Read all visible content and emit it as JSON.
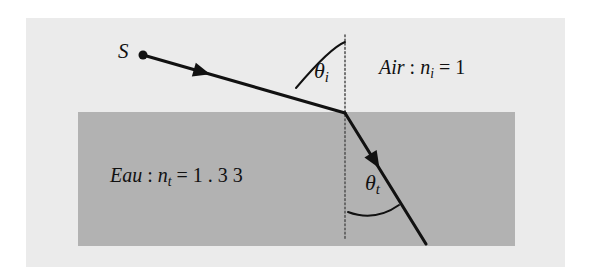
{
  "figure": {
    "kind": "optics-refraction-diagram",
    "colors": {
      "page_background": "#ffffff",
      "panel_background": "#ebebeb",
      "water_fill": "#b2b2b2",
      "ray_color": "#111111",
      "normal_line_color": "#555555",
      "text_color": "#111111"
    },
    "panel": {
      "x": 26,
      "y": 18,
      "width": 539,
      "height": 249
    },
    "water_region": {
      "x": 78,
      "y": 112,
      "width": 437,
      "height": 134
    },
    "normal_line": {
      "x": 345,
      "y_top": 35,
      "y_bottom": 240,
      "style": "dotted"
    },
    "interface_point": {
      "x": 345,
      "y": 113
    },
    "incident_ray": {
      "from": {
        "x": 143,
        "y": 55
      },
      "to": {
        "x": 345,
        "y": 113
      },
      "arrow_at": {
        "x": 202,
        "y": 72
      }
    },
    "refracted_ray": {
      "from": {
        "x": 345,
        "y": 113
      },
      "to": {
        "x": 426,
        "y": 244
      },
      "arrow_at": {
        "x": 375,
        "y": 161
      }
    },
    "source_dot": {
      "x": 143,
      "y": 55,
      "radius": 4.5
    }
  },
  "labels": {
    "source": "S",
    "theta_incident": {
      "symbol": "θ",
      "subscript": "i"
    },
    "theta_transmitted": {
      "symbol": "θ",
      "subscript": "t"
    },
    "air": {
      "medium": "Air",
      "separator": " : ",
      "index_symbol": "n",
      "index_subscript": "i",
      "equals": " = ",
      "value": "1"
    },
    "water": {
      "medium": "Eau",
      "separator": " : ",
      "index_symbol": "n",
      "index_subscript": "t",
      "equals": " = ",
      "value": "1 . 3 3"
    }
  }
}
